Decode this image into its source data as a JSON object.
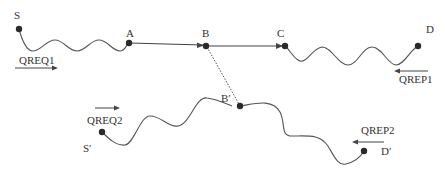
{
  "diagram": {
    "nodes": {
      "S": {
        "label": "S"
      },
      "A": {
        "label": "A"
      },
      "B": {
        "label": "B"
      },
      "C": {
        "label": "C"
      },
      "D": {
        "label": "D"
      },
      "B_prime": {
        "label": "B′"
      },
      "S_prime": {
        "label": "S′"
      },
      "D_prime": {
        "label": "D′"
      }
    },
    "messages": {
      "qreq1": {
        "label": "QREQ1",
        "direction": "right"
      },
      "qrep1": {
        "label": "QREP1",
        "direction": "left"
      },
      "qreq2": {
        "label": "QREQ2",
        "direction": "right"
      },
      "qrep2": {
        "label": "QREP2",
        "direction": "left"
      }
    },
    "edges": [
      {
        "from": "S",
        "to": "A",
        "style": "wavy"
      },
      {
        "from": "A",
        "to": "B",
        "style": "straight-arrow"
      },
      {
        "from": "B",
        "to": "C",
        "style": "straight-arrow"
      },
      {
        "from": "C",
        "to": "D",
        "style": "wavy"
      },
      {
        "from": "B",
        "to": "B_prime",
        "style": "dotted"
      },
      {
        "from": "S_prime",
        "to": "B_prime",
        "style": "wavy"
      },
      {
        "from": "B_prime",
        "to": "D_prime",
        "style": "wavy"
      }
    ]
  }
}
